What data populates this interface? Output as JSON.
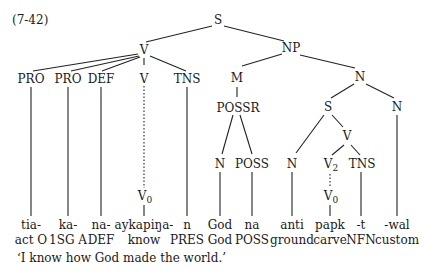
{
  "example_number": "(7-42)",
  "tree": {
    "root": "S",
    "left_V": "V",
    "NP": "NP",
    "pro1": "PRO",
    "pro2": "PRO",
    "def": "DEF",
    "v_inner": "V",
    "tns1": "TNS",
    "v0_1_base": "V",
    "v0_1_sub": "0",
    "M": "M",
    "possr": "POSSR",
    "n_god": "N",
    "poss": "POSS",
    "N_right": "N",
    "S_inner": "S",
    "N_custom": "N",
    "N_anti": "N",
    "V_inner2": "V",
    "v2_base": "V",
    "v2_sub": "2",
    "tns2": "TNS",
    "v0_2_base": "V",
    "v0_2_sub": "0"
  },
  "morphemes": [
    {
      "form": "tia-",
      "gloss": "act O"
    },
    {
      "form": "ka-",
      "gloss": "1SG A"
    },
    {
      "form": "na-",
      "gloss": "DEF"
    },
    {
      "form": "aykapiŋa-",
      "gloss": "know"
    },
    {
      "form": "n",
      "gloss": "PRES"
    },
    {
      "form": "God",
      "gloss": "God"
    },
    {
      "form": "na",
      "gloss": "POSS"
    },
    {
      "form": "anti",
      "gloss": "ground"
    },
    {
      "form": "papk",
      "gloss": "carve"
    },
    {
      "form": "-t",
      "gloss": "NFN"
    },
    {
      "form": "-wal",
      "gloss": "custom"
    }
  ],
  "translation": "‘I know how God made the world.’"
}
